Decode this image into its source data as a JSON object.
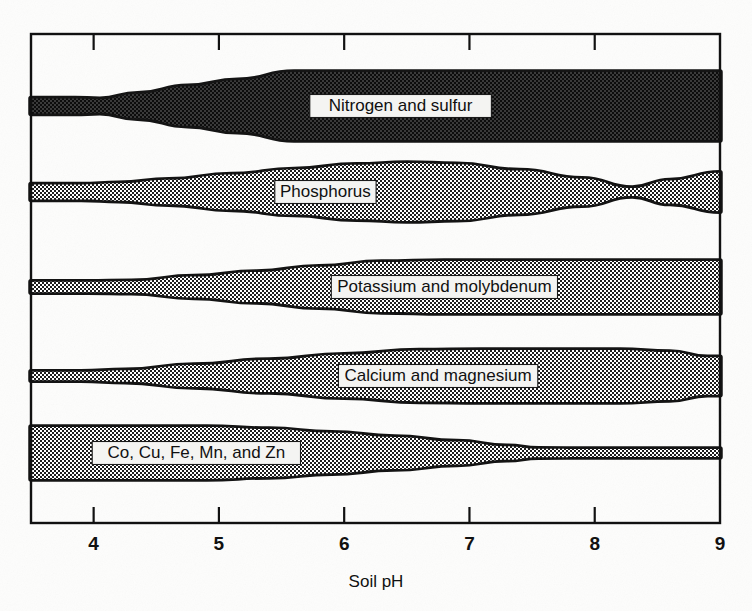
{
  "figure": {
    "axis_title": "Soil pH",
    "x_ticks": [
      "4",
      "5",
      "6",
      "7",
      "8",
      "9"
    ],
    "band_labels": [
      "Nitrogen and sulfur",
      "Phosphorus",
      "Potassium and molybdenum",
      "Calcium and magnesium",
      "Co, Cu, Fe, Mn, and Zn"
    ],
    "colors": {
      "band_fill": "#6e6e6e",
      "band_edge": "#141414",
      "frame": "#111111",
      "label_box": "#f4f4f2",
      "paper": "#fdfdfc",
      "text": "#101010"
    }
  },
  "chart_data": {
    "type": "area",
    "title": "",
    "subtitle": "",
    "xlabel": "Soil pH",
    "ylabel": "",
    "xlim": [
      3.5,
      9.0
    ],
    "ylim": [
      0,
      5
    ],
    "grid": false,
    "legend": "inline-labels",
    "x_tick_values": [
      4,
      5,
      6,
      7,
      8,
      9
    ],
    "annotations": [
      "Nitrogen and sulfur",
      "Phosphorus",
      "Potassium and molybdenum",
      "Calcium and magnesium",
      "Co, Cu, Fe, Mn, and Zn"
    ],
    "note": "Band thickness encodes relative nutrient availability versus soil pH; thickness values are normalized 0-1.",
    "series": [
      {
        "name": "Nitrogen and sulfur",
        "label_x": 6.45,
        "x": [
          3.5,
          3.85,
          4.05,
          4.35,
          4.75,
          5.15,
          5.6,
          6.2,
          7.0,
          7.8,
          8.4,
          8.8,
          9.0
        ],
        "thickness": [
          0.22,
          0.22,
          0.2,
          0.36,
          0.58,
          0.76,
          1.0,
          1.0,
          1.0,
          1.0,
          1.0,
          1.0,
          1.0
        ]
      },
      {
        "name": "Phosphorus",
        "label_x": 5.85,
        "x": [
          3.5,
          3.9,
          4.2,
          4.6,
          5.1,
          5.6,
          6.1,
          6.5,
          6.9,
          7.4,
          7.9,
          8.3,
          8.6,
          9.0
        ],
        "thickness": [
          0.26,
          0.26,
          0.3,
          0.42,
          0.6,
          0.78,
          0.94,
          1.0,
          0.96,
          0.74,
          0.46,
          0.14,
          0.4,
          0.66
        ]
      },
      {
        "name": "Potassium and molybdenum",
        "label_x": 6.8,
        "x": [
          3.5,
          3.95,
          4.3,
          4.8,
          5.3,
          5.8,
          6.3,
          6.8,
          7.4,
          8.0,
          8.6,
          9.0
        ],
        "thickness": [
          0.2,
          0.2,
          0.22,
          0.4,
          0.58,
          0.78,
          0.96,
          1.0,
          1.0,
          1.0,
          1.0,
          1.0
        ]
      },
      {
        "name": "Calcium and magnesium",
        "label_x": 6.75,
        "x": [
          3.5,
          3.9,
          4.25,
          4.8,
          5.4,
          6.0,
          6.6,
          7.1,
          7.7,
          8.2,
          8.6,
          8.9,
          9.0
        ],
        "thickness": [
          0.16,
          0.16,
          0.22,
          0.42,
          0.62,
          0.82,
          0.98,
          1.0,
          1.0,
          1.0,
          0.92,
          0.72,
          0.72
        ]
      },
      {
        "name": "Co, Cu, Fe, Mn, and Zn",
        "label_x": 4.82,
        "x": [
          3.5,
          4.2,
          4.9,
          5.4,
          5.9,
          6.4,
          6.9,
          7.3,
          7.55,
          8.0,
          8.5,
          9.0
        ],
        "thickness": [
          1.0,
          1.0,
          1.0,
          0.92,
          0.78,
          0.62,
          0.44,
          0.26,
          0.16,
          0.15,
          0.15,
          0.15
        ]
      }
    ]
  }
}
